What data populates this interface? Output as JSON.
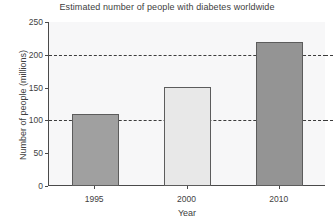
{
  "chart_data": {
    "type": "bar",
    "title": "Estimated number of people with diabetes worldwide",
    "xlabel": "Year",
    "ylabel": "Number of people (millions)",
    "categories": [
      "1995",
      "2000",
      "2010"
    ],
    "values": [
      110,
      151,
      220
    ],
    "bar_colors": [
      "#a0a0a0",
      "#e8e8e8",
      "#949494"
    ],
    "bar_edge_color": "#5c5c5c",
    "ylim": [
      0,
      250
    ],
    "yticks": [
      0,
      50,
      100,
      150,
      200,
      250
    ],
    "ytick_labels": [
      "0",
      "50",
      "100",
      "150",
      "200",
      "250"
    ],
    "grid": true,
    "gridlines": [
      100,
      200
    ],
    "gridline_style": "dashed",
    "legend": null,
    "plot_background": "#f7f7f8",
    "axis_color": "#4a4a4a"
  }
}
